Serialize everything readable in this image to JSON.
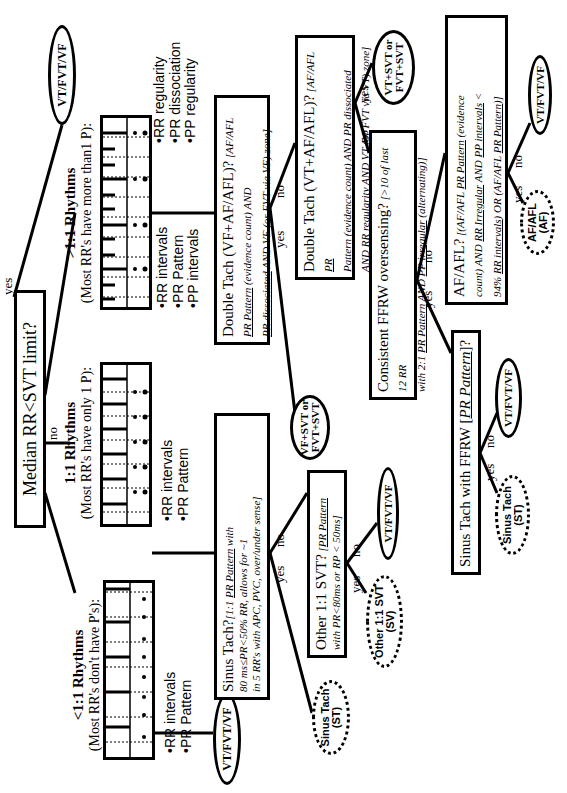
{
  "root": {
    "question": "Median RR<SVT limit?",
    "yes": "yes",
    "no": "no"
  },
  "terminals": {
    "vt_fvt_vf": "VT/FVT/VF",
    "vf_svt": [
      "VF+SVT or",
      "FVT+SVT"
    ],
    "vt_svt": [
      "VT+SVT or",
      "FVT+SVT"
    ],
    "sinus_tach": [
      "Sinus Tach",
      "(ST)"
    ],
    "other_svt": [
      "Other 1:1 SVT",
      "(SV)"
    ],
    "af": [
      "AF/AFL",
      "(AF)"
    ]
  },
  "categories": {
    "less": {
      "title": "<1:1 Rhythms",
      "subtitle": "(Most RR's don't have P's):",
      "bullets": [
        "•RR intervals",
        "•PR Pattern"
      ]
    },
    "equal": {
      "title": "1:1 Rhythms",
      "subtitle": "(Most RR's have only 1 P):",
      "bullets": [
        "•RR intervals",
        "•PR Pattern"
      ]
    },
    "greater": {
      "title": ">1:1 Rhythms",
      "subtitle": "(Most RR's have more than1 P):",
      "bullets": [
        "•RR intervals",
        "•PR Pattern",
        "•PP intervals"
      ],
      "bullets2": [
        "•RR regularity",
        "•PR dissociation",
        "•PP regularity"
      ]
    }
  },
  "nodes": {
    "sinus_tach_q": {
      "title": "Sinus Tach?",
      "l1": "[1:1 ",
      "l1u": "PR Pattern",
      "l1b": " with",
      "l2": "80 ms≤PR<50% RR, allows for ~1",
      "l3": "in 5 RR's with APC, PVC, over/under sense]"
    },
    "other_svt_q": {
      "title": "Other 1:1 SVT?",
      "l1": " [",
      "l1u": "PR Pattern",
      "l2": "with PR<80ms or RP < 50ms]"
    },
    "double_tach_vf": {
      "title": "Double Tach (VF+AF/AFL)?",
      "l1": " [AF/AFL",
      "l2u": "PR Pattern",
      "l2": " (evidence count) AND",
      "l3u": "PR dissociated",
      "l3": " AND VF (or FVT via VF) zone]"
    },
    "double_tach_vt": {
      "title": "Double Tach (VT+AF/AFL)?",
      "l1": " [AF/AFL ",
      "l1u": "PR",
      "l2u": "Pattern",
      "l2": " (evidence count) AND ",
      "l2u2": "PR dissociated",
      "l3": "AND ",
      "l3u": "RR regularity",
      "l3b": " AND VT (or FVT via VT) zone]"
    },
    "ffrw": {
      "title": "Consistent FFRW oversensing?",
      "l1": " [>10 of last 12 RR",
      "l2": "with 2:1 ",
      "l2u": "PR Pattern",
      "l2b": " AND ",
      "l2u2": "PP irregular",
      "l2c": " (alternating)]"
    },
    "sinus_ffrw": {
      "title": "Sinus Tach with FFRW [",
      "u": "PR Pattern",
      "end": "]?"
    },
    "afafl": {
      "title": "AF/AFL?",
      "l1": " [(AF/AFL ",
      "l1u": "PR Pattern",
      "l1b": " (evidence",
      "l2": "count) AND ",
      "l2u": "RR Irregular",
      "l2b": " AND ",
      "l2u2": "PP intervals",
      "l2c": " <",
      "l3": "94% ",
      "l3u": "RR intervals",
      "l3b": ") OR (AF/AFL ",
      "l3u2": "PR Pattern",
      "l3c": ")]"
    }
  },
  "edge_labels": {
    "yes": "yes",
    "no": "no"
  }
}
